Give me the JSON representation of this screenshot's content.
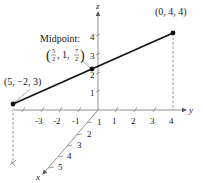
{
  "diagram": {
    "axes": {
      "x": {
        "label": "x",
        "ticks": [
          "1",
          "2",
          "3",
          "4",
          "5"
        ]
      },
      "y": {
        "label": "y",
        "ticks": [
          "-3",
          "-2",
          "-1",
          "1",
          "2",
          "3",
          "4"
        ]
      },
      "z": {
        "label": "z",
        "ticks": [
          "1",
          "2",
          "3",
          "4"
        ]
      }
    },
    "points": {
      "p1": {
        "label": "(5, −2, 3)"
      },
      "p2": {
        "label": "(0, 4, 4)"
      },
      "mid": {
        "title": "Midpoint:",
        "open": "(",
        "x_num": "5",
        "x_den": "2",
        "sep1": ", 1, ",
        "z_num": "7",
        "z_den": "2",
        "close": ")"
      }
    },
    "colors": {
      "ink": "#1a1a1a",
      "dash": "#555555"
    }
  }
}
